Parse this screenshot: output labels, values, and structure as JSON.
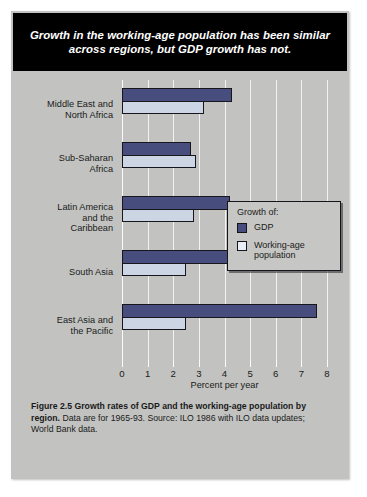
{
  "headline": "Growth in the working-age population has been similar across regions, but GDP growth has not.",
  "legend": {
    "title": "Growth of:",
    "items": [
      {
        "label": "GDP",
        "color": "#474e7e"
      },
      {
        "label": "Working-age\npopulation",
        "color": "#e9eef6"
      }
    ]
  },
  "caption": {
    "bold": "Figure 2.5 Growth rates of GDP and the working-age population by region.",
    "rest": " Data are for 1965-93. Source: ILO 1986 with ILO data updates; World Bank data."
  },
  "chart_data": {
    "type": "bar",
    "orientation": "horizontal",
    "title": "",
    "xlabel": "Percent per year",
    "ylabel": "",
    "xlim": [
      0,
      8
    ],
    "xticks": [
      0,
      1,
      2,
      3,
      4,
      5,
      6,
      7,
      8
    ],
    "xticklabels": [
      "0",
      "1",
      "2",
      "3",
      "4",
      "5",
      "6",
      "7",
      "8"
    ],
    "grid": true,
    "legend_position": "inside-upper-right",
    "categories": [
      "Middle East and North Africa",
      "Sub-Saharan Africa",
      "Latin America and the Caribbean",
      "South Asia",
      "East Asia and the Pacific"
    ],
    "category_lines": [
      [
        "Middle East and",
        "North Africa"
      ],
      [
        "Sub-Saharan",
        "Africa"
      ],
      [
        "Latin America",
        "and the",
        "Caribbean"
      ],
      [
        "South Asia"
      ],
      [
        "East Asia and",
        "the Pacific"
      ]
    ],
    "series": [
      {
        "name": "GDP",
        "color": "#474e7e",
        "values": [
          4.3,
          2.7,
          4.2,
          4.3,
          7.6
        ]
      },
      {
        "name": "Working-age population",
        "color": "#ccd5e4",
        "values": [
          3.2,
          2.9,
          2.8,
          2.5,
          2.5
        ]
      }
    ]
  }
}
